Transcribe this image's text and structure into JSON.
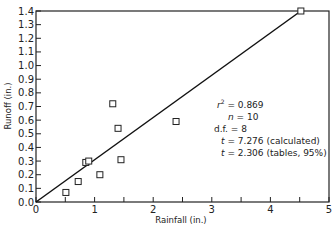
{
  "chart_data": {
    "type": "scatter",
    "title": "",
    "xlabel": "Rainfall (in.)",
    "ylabel": "Runoff (in.)",
    "xlim": [
      0,
      5
    ],
    "ylim": [
      0.0,
      1.4
    ],
    "x_ticks": [
      "0",
      "1",
      "2",
      "3",
      "4",
      "5"
    ],
    "y_ticks": [
      "0.0",
      "0.1",
      "0.2",
      "0.3",
      "0.4",
      "0.5",
      "0.6",
      "0.7",
      "0.8",
      "0.9",
      "1.0",
      "1.1",
      "1.2",
      "1.3",
      "1.4"
    ],
    "grid": false,
    "series": [
      {
        "name": "Observations",
        "marker": "open-square",
        "x": [
          0.51,
          0.72,
          0.85,
          0.9,
          1.09,
          1.31,
          1.4,
          1.45,
          2.39,
          4.52
        ],
        "y": [
          0.07,
          0.15,
          0.29,
          0.3,
          0.2,
          0.72,
          0.54,
          0.31,
          0.59,
          1.4
        ]
      },
      {
        "name": "Regression line",
        "type": "line",
        "x": [
          0,
          4.52
        ],
        "y": [
          0,
          1.4
        ]
      }
    ],
    "annotations": [
      "r² = 0.869",
      "n = 10",
      "d.f. = 8",
      "t = 7.276 (calculated)",
      "t = 2.306 (tables, 95%)"
    ]
  },
  "labels": {
    "xlabel": "Rainfall (in.)",
    "ylabel": "Runoff (in.)",
    "r2_val": "= 0.869",
    "n_val": "= 10",
    "df": "d.f. = 8",
    "t_calc": "= 7.276 (calculated)",
    "t_tab": "= 2.306 (tables, 95%)"
  }
}
